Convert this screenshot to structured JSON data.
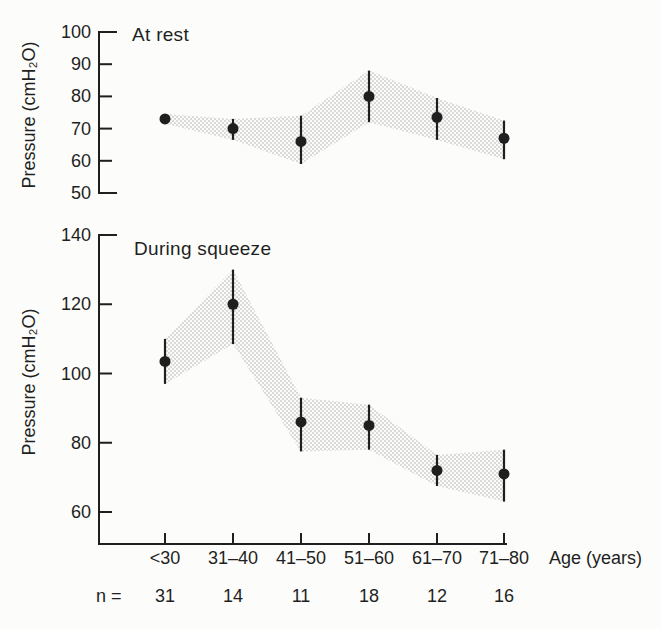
{
  "figure": {
    "bg": "#fcfcfa",
    "ink": "#1f1f1f",
    "stipple_color": "#9e9e9e"
  },
  "chart_data": [
    {
      "type": "scatter",
      "title": "At rest",
      "ylabel": "Pressure (cmH₂O)",
      "xlabel": "Age (years)",
      "categories": [
        "<30",
        "31–40",
        "41–50",
        "51–60",
        "61–70",
        "71–80"
      ],
      "series": [
        {
          "name": "mean pressure",
          "values": [
            73,
            70,
            66,
            80,
            73.5,
            67
          ]
        }
      ],
      "error_low": [
        71.5,
        66.5,
        59,
        72,
        66.5,
        60.5
      ],
      "error_high": [
        74.5,
        73,
        74,
        88,
        79.5,
        72.5
      ],
      "band": "stippled region spanning error_low to error_high",
      "yticks": [
        100,
        90,
        80,
        70,
        60,
        50
      ],
      "ylim": [
        50,
        100
      ],
      "grid": false,
      "legend": "none"
    },
    {
      "type": "scatter",
      "title": "During squeeze",
      "ylabel": "Pressure (cmH₂O)",
      "xlabel": "Age (years)",
      "categories": [
        "<30",
        "31–40",
        "41–50",
        "51–60",
        "61–70",
        "71–80"
      ],
      "series": [
        {
          "name": "mean pressure",
          "values": [
            103.5,
            120,
            86,
            85,
            72,
            71
          ]
        }
      ],
      "error_low": [
        97,
        108.5,
        77.5,
        78,
        67.5,
        63
      ],
      "error_high": [
        110,
        130,
        93,
        91,
        76.5,
        78
      ],
      "band": "stippled region spanning error_low to error_high",
      "yticks": [
        140,
        120,
        100,
        80,
        60
      ],
      "ylim": [
        52,
        140
      ],
      "grid": false,
      "legend": "none"
    }
  ],
  "x_axis": {
    "label": "Age (years)",
    "categories": [
      "<30",
      "31–40",
      "41–50",
      "51–60",
      "61–70",
      "71–80"
    ]
  },
  "sample_sizes": {
    "label": "n =",
    "values": [
      "31",
      "14",
      "11",
      "18",
      "12",
      "16"
    ]
  }
}
